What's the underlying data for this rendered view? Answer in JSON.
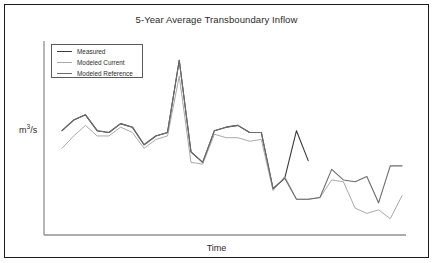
{
  "chart_data": {
    "type": "line",
    "title": "5-Year Average Transboundary Inflow",
    "xlabel": "Time",
    "ylabel": "m3/s",
    "ylabel_html": "m<sup>3</sup>/s",
    "grid": false,
    "legend_position": "top-left",
    "axis_ticks": [],
    "xlim": [
      0,
      29
    ],
    "ylim": [
      0,
      100
    ],
    "x": [
      0,
      1,
      2,
      3,
      4,
      5,
      6,
      7,
      8,
      9,
      10,
      11,
      12,
      13,
      14,
      15,
      16,
      17,
      18,
      19,
      20,
      21,
      22,
      23,
      24,
      25,
      26,
      27,
      28,
      29
    ],
    "series": [
      {
        "name": "Measured",
        "color": "#3a3a3a",
        "width": 1.1,
        "values": [
          57,
          63,
          66,
          57,
          56,
          61,
          59,
          49,
          54,
          56,
          97,
          45,
          39,
          57,
          59,
          60,
          56,
          56,
          24,
          30,
          57,
          40,
          null,
          null,
          null,
          null,
          null,
          null,
          null,
          null
        ]
      },
      {
        "name": "Modeled Current",
        "color": "#a8a8a8",
        "width": 1.0,
        "values": [
          47,
          54,
          60,
          54,
          54,
          59,
          56,
          47,
          52,
          54,
          88,
          39,
          38,
          55,
          53,
          53,
          51,
          52,
          23,
          31,
          18,
          18,
          19,
          29,
          28,
          13,
          10,
          12,
          7,
          20
        ]
      },
      {
        "name": "Modeled Reference",
        "color": "#6b6b6b",
        "width": 1.1,
        "values": [
          57,
          63,
          66,
          57,
          56,
          61,
          59,
          49,
          54,
          56,
          97,
          45,
          39,
          57,
          59,
          60,
          56,
          56,
          24,
          30,
          18,
          18,
          19,
          35,
          29,
          28,
          31,
          16,
          37,
          37
        ]
      }
    ]
  },
  "legend": {
    "items": [
      {
        "label": "Measured",
        "color": "#3a3a3a"
      },
      {
        "label": "Modeled Current",
        "color": "#a8a8a8"
      },
      {
        "label": "Modeled Reference",
        "color": "#6b6b6b"
      }
    ]
  },
  "axes": {
    "line_color": "#909090"
  }
}
